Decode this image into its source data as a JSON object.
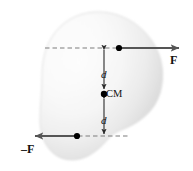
{
  "figure": {
    "body_label": "rigid-body-blob",
    "labels": {
      "force_positive": "F",
      "force_negative": "–F",
      "distance_top": "d",
      "distance_bottom": "d",
      "center_of_mass": "CM"
    },
    "colors": {
      "background": "#ffffff",
      "body_fill_light": "#fcfcfc",
      "body_fill_mid": "#ededed",
      "body_fill_dark": "#d8d8d8",
      "body_edge": "#cfcfcf",
      "arrow": "#555555",
      "dashed_line": "#808080",
      "dimension_line": "#333333",
      "point_dot": "#000000",
      "text": "#111111"
    },
    "geometry": {
      "width": 193,
      "height": 171,
      "center_of_mass_point": [
        104,
        94
      ],
      "top_force_application_point": [
        119,
        48
      ],
      "bottom_force_application_point": [
        77,
        136
      ],
      "top_arrow_tip": [
        186,
        48
      ],
      "bottom_arrow_tip": [
        28,
        136
      ],
      "dimension_axis_x": 104,
      "top_dashed_line_y": 48,
      "bottom_dashed_line_y": 136
    },
    "annotations": {
      "arrow_direction_top": "right",
      "arrow_direction_bottom": "left",
      "dimension_top": "double-headed vertical arrow from top force line to CM",
      "dimension_bottom": "double-headed vertical arrow from CM to bottom force line"
    }
  }
}
